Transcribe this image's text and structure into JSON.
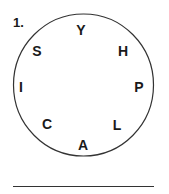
{
  "puzzle": {
    "number": "1.",
    "letters": [
      {
        "char": "Y",
        "x": 81,
        "y": 30
      },
      {
        "char": "H",
        "x": 123,
        "y": 51
      },
      {
        "char": "P",
        "x": 139,
        "y": 87
      },
      {
        "char": "L",
        "x": 117,
        "y": 125
      },
      {
        "char": "A",
        "x": 83,
        "y": 145
      },
      {
        "char": "C",
        "x": 47,
        "y": 124
      },
      {
        "char": "I",
        "x": 21,
        "y": 87
      },
      {
        "char": "S",
        "x": 37,
        "y": 51
      }
    ],
    "answer": ""
  }
}
